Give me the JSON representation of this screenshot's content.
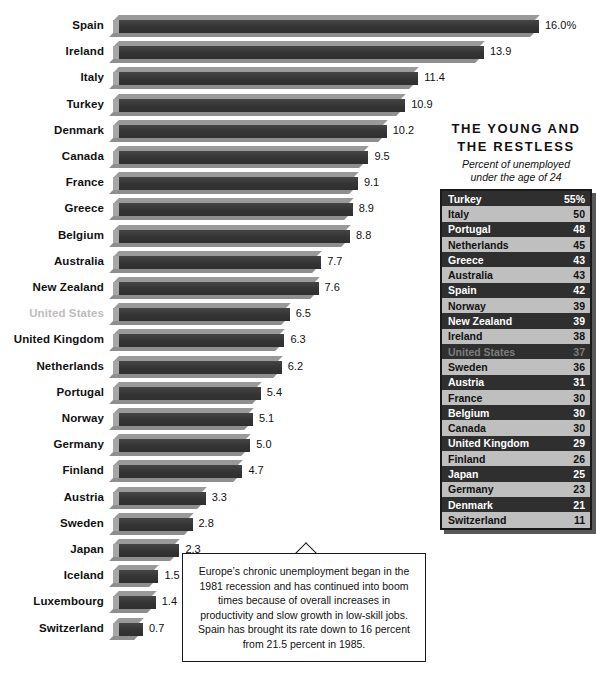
{
  "chart_data": {
    "type": "bar",
    "title": "",
    "xlabel": "",
    "ylabel": "",
    "orientation": "horizontal",
    "value_suffix_first": "%",
    "grid": false,
    "xlim": [
      0,
      16
    ],
    "categories": [
      "Spain",
      "Ireland",
      "Italy",
      "Turkey",
      "Denmark",
      "Canada",
      "France",
      "Greece",
      "Belgium",
      "Australia",
      "New Zealand",
      "United States",
      "United Kingdom",
      "Netherlands",
      "Portugal",
      "Norway",
      "Germany",
      "Finland",
      "Austria",
      "Sweden",
      "Japan",
      "Iceland",
      "Luxembourg",
      "Switzerland"
    ],
    "values": [
      16.0,
      13.9,
      11.4,
      10.9,
      10.2,
      9.5,
      9.1,
      8.9,
      8.8,
      7.7,
      7.6,
      6.5,
      6.3,
      6.2,
      5.4,
      5.1,
      5.0,
      4.7,
      3.3,
      2.8,
      2.3,
      1.5,
      1.4,
      0.7
    ],
    "value_labels": [
      "16.0%",
      "13.9",
      "11.4",
      "10.9",
      "10.2",
      "9.5",
      "9.1",
      "8.9",
      "8.8",
      "7.7",
      "7.6",
      "6.5",
      "6.3",
      "6.2",
      "5.4",
      "5.1",
      "5.0",
      "4.7",
      "3.3",
      "2.8",
      "2.3",
      "1.5",
      "1.4",
      "0.7"
    ],
    "highlighted_muted_category": "United States"
  },
  "bars": [
    {
      "label": "Spain",
      "value": 16.0,
      "value_label": "16.0%",
      "muted": false
    },
    {
      "label": "Ireland",
      "value": 13.9,
      "value_label": "13.9",
      "muted": false
    },
    {
      "label": "Italy",
      "value": 11.4,
      "value_label": "11.4",
      "muted": false
    },
    {
      "label": "Turkey",
      "value": 10.9,
      "value_label": "10.9",
      "muted": false
    },
    {
      "label": "Denmark",
      "value": 10.2,
      "value_label": "10.2",
      "muted": false
    },
    {
      "label": "Canada",
      "value": 9.5,
      "value_label": "9.5",
      "muted": false
    },
    {
      "label": "France",
      "value": 9.1,
      "value_label": "9.1",
      "muted": false
    },
    {
      "label": "Greece",
      "value": 8.9,
      "value_label": "8.9",
      "muted": false
    },
    {
      "label": "Belgium",
      "value": 8.8,
      "value_label": "8.8",
      "muted": false
    },
    {
      "label": "Australia",
      "value": 7.7,
      "value_label": "7.7",
      "muted": false
    },
    {
      "label": "New Zealand",
      "value": 7.6,
      "value_label": "7.6",
      "muted": false
    },
    {
      "label": "United States",
      "value": 6.5,
      "value_label": "6.5",
      "muted": true
    },
    {
      "label": "United Kingdom",
      "value": 6.3,
      "value_label": "6.3",
      "muted": false
    },
    {
      "label": "Netherlands",
      "value": 6.2,
      "value_label": "6.2",
      "muted": false
    },
    {
      "label": "Portugal",
      "value": 5.4,
      "value_label": "5.4",
      "muted": false
    },
    {
      "label": "Norway",
      "value": 5.1,
      "value_label": "5.1",
      "muted": false
    },
    {
      "label": "Germany",
      "value": 5.0,
      "value_label": "5.0",
      "muted": false
    },
    {
      "label": "Finland",
      "value": 4.7,
      "value_label": "4.7",
      "muted": false
    },
    {
      "label": "Austria",
      "value": 3.3,
      "value_label": "3.3",
      "muted": false
    },
    {
      "label": "Sweden",
      "value": 2.8,
      "value_label": "2.8",
      "muted": false
    },
    {
      "label": "Japan",
      "value": 2.3,
      "value_label": "2.3",
      "muted": false
    },
    {
      "label": "Iceland",
      "value": 1.5,
      "value_label": "1.5",
      "muted": false
    },
    {
      "label": "Luxembourg",
      "value": 1.4,
      "value_label": "1.4",
      "muted": false
    },
    {
      "label": "Switzerland",
      "value": 0.7,
      "value_label": "0.7",
      "muted": false
    }
  ],
  "panel": {
    "title_line1": "THE YOUNG AND",
    "title_line2": "THE RESTLESS",
    "subtitle_line1": "Percent of unemployed",
    "subtitle_line2": "under the age of 24",
    "rows": [
      {
        "name": "Turkey",
        "value": "55%",
        "muted": false
      },
      {
        "name": "Italy",
        "value": "50",
        "muted": false
      },
      {
        "name": "Portugal",
        "value": "48",
        "muted": false
      },
      {
        "name": "Netherlands",
        "value": "45",
        "muted": false
      },
      {
        "name": "Greece",
        "value": "43",
        "muted": false
      },
      {
        "name": "Australia",
        "value": "43",
        "muted": false
      },
      {
        "name": "Spain",
        "value": "42",
        "muted": false
      },
      {
        "name": "Norway",
        "value": "39",
        "muted": false
      },
      {
        "name": "New Zealand",
        "value": "39",
        "muted": false
      },
      {
        "name": "Ireland",
        "value": "38",
        "muted": false
      },
      {
        "name": "United States",
        "value": "37",
        "muted": true
      },
      {
        "name": "Sweden",
        "value": "36",
        "muted": false
      },
      {
        "name": "Austria",
        "value": "31",
        "muted": false
      },
      {
        "name": "France",
        "value": "30",
        "muted": false
      },
      {
        "name": "Belgium",
        "value": "30",
        "muted": false
      },
      {
        "name": "Canada",
        "value": "30",
        "muted": false
      },
      {
        "name": "United Kingdom",
        "value": "29",
        "muted": false
      },
      {
        "name": "Finland",
        "value": "26",
        "muted": false
      },
      {
        "name": "Japan",
        "value": "25",
        "muted": false
      },
      {
        "name": "Germany",
        "value": "23",
        "muted": false
      },
      {
        "name": "Denmark",
        "value": "21",
        "muted": false
      },
      {
        "name": "Switzerland",
        "value": "11",
        "muted": false
      }
    ]
  },
  "callout": {
    "text": "Europe’s chronic unemployment began in the 1981 recession and has continued into boom times because of overall increases in productivity and slow growth in low-skill jobs. Spain has brought its rate down to 16 percent from 21.5 percent in 1985."
  },
  "colors": {
    "bar_face": "#3a3a3a",
    "bar_bevel": "#9a9a9a",
    "table_dark_row": "#2f2f2f",
    "table_light_row": "#bfbfbf",
    "muted_text": "#bdbdbd",
    "border": "#1a1a1a"
  }
}
